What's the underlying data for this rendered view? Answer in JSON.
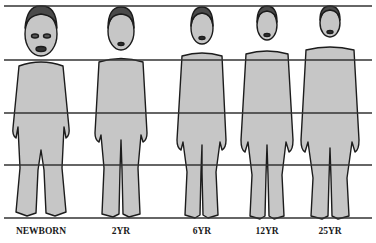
{
  "diagram": {
    "colors": {
      "skin": "#c6c6c6",
      "outline": "#1c1c1c",
      "hair": "#4a4a4a",
      "line": "#333333"
    },
    "gridlines_y": [
      6,
      60,
      113,
      165,
      218
    ],
    "figures": [
      {
        "label": "NEWBORN",
        "cx": 41
      },
      {
        "label": "2YR",
        "cx": 121
      },
      {
        "label": "6YR",
        "cx": 202
      },
      {
        "label": "12YR",
        "cx": 267
      },
      {
        "label": "25YR",
        "cx": 330
      }
    ]
  }
}
